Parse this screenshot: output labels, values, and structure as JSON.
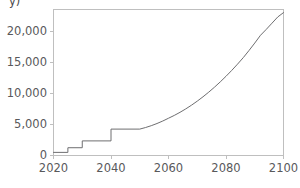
{
  "chart_data": {
    "type": "line",
    "title": "",
    "subtitle": "",
    "xlabel": "",
    "ylabel": "",
    "clipped_axis_title": "y)",
    "xlim": [
      2020,
      2100
    ],
    "ylim": [
      0,
      23500
    ],
    "grid": false,
    "legend": null,
    "legend_position": "none",
    "line_color": "#6e6e70",
    "axis_color": "#bfbfbf",
    "tick_label_color": "#59595b",
    "background_color": "#ffffff",
    "xticks": [
      2020,
      2040,
      2060,
      2080,
      2100
    ],
    "xtick_labels": [
      "2020",
      "2040",
      "2060",
      "2080",
      "2100"
    ],
    "yticks": [
      0,
      5000,
      10000,
      15000,
      20000
    ],
    "ytick_labels": [
      "0",
      "5,000",
      "10,000",
      "15,000",
      "20,000"
    ],
    "series": [
      {
        "name": "series-1",
        "x": [
          2020,
          2025,
          2025,
          2030,
          2030,
          2040,
          2040,
          2050,
          2052,
          2054,
          2056,
          2058,
          2060,
          2062,
          2064,
          2066,
          2068,
          2070,
          2072,
          2074,
          2076,
          2078,
          2080,
          2082,
          2084,
          2086,
          2088,
          2090,
          2092,
          2094,
          2096,
          2098,
          2100
        ],
        "values": [
          500,
          500,
          1250,
          1250,
          2350,
          2350,
          4250,
          4250,
          4500,
          4800,
          5150,
          5550,
          6000,
          6450,
          6950,
          7500,
          8100,
          8750,
          9450,
          10200,
          11000,
          11850,
          12750,
          13700,
          14700,
          15750,
          16900,
          18100,
          19350,
          20300,
          21300,
          22300,
          23000
        ]
      }
    ],
    "annotations": []
  },
  "axes": {
    "x_axis_name": "x-axis-years",
    "y_axis_name": "y-axis-values"
  }
}
